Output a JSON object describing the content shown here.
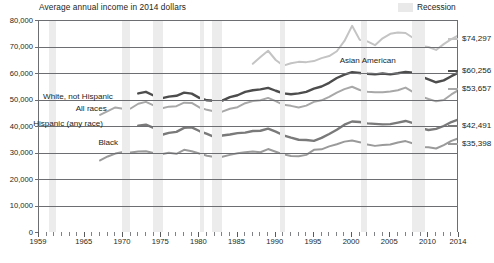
{
  "chart_data": {
    "type": "line",
    "title": "Average annual income in 2014 dollars",
    "xlabel": "",
    "ylabel": "",
    "xlim": [
      1959,
      2014
    ],
    "ylim": [
      0,
      80000
    ],
    "grid": true,
    "legend_position": "top-right",
    "legend_entries": [
      {
        "label": "Recession",
        "color": "#ececec",
        "type": "band"
      }
    ],
    "ytick_labels": [
      "0",
      "10,000",
      "20,000",
      "30,000",
      "40,000",
      "50,000",
      "60,000",
      "70,000",
      "80,000"
    ],
    "ytick_values": [
      0,
      10000,
      20000,
      30000,
      40000,
      50000,
      60000,
      70000,
      80000
    ],
    "xtick_labels": [
      "1959",
      "1965",
      "1970",
      "1975",
      "1980",
      "1985",
      "1990",
      "1995",
      "2000",
      "2005",
      "2010",
      "2014"
    ],
    "xtick_values": [
      1959,
      1965,
      1970,
      1975,
      1980,
      1985,
      1990,
      1995,
      2000,
      2005,
      2010,
      2014
    ],
    "recession_bands": [
      {
        "start": 1960.3,
        "end": 1961.2
      },
      {
        "start": 1969.9,
        "end": 1970.9
      },
      {
        "start": 1973.9,
        "end": 1975.2
      },
      {
        "start": 1980.1,
        "end": 1980.6
      },
      {
        "start": 1981.6,
        "end": 1982.9
      },
      {
        "start": 1990.6,
        "end": 1991.2
      },
      {
        "start": 2001.2,
        "end": 2001.9
      },
      {
        "start": 2007.9,
        "end": 2009.5
      }
    ],
    "series": [
      {
        "name": "Asian American",
        "color": "#c4c4c4",
        "width": 2.0,
        "end_label": "$74,297",
        "end_value": 74297,
        "label_x": 1998.5,
        "label_y": 64400,
        "x": [
          1987,
          1988,
          1989,
          1990,
          1991,
          1992,
          1993,
          1994,
          1995,
          1996,
          1997,
          1998,
          1999,
          2000,
          2001,
          2002,
          2003,
          2004,
          2005,
          2006,
          2007,
          2008,
          2009,
          2010,
          2011,
          2012,
          2013,
          2014
        ],
        "values": [
          63500,
          66000,
          68400,
          64900,
          62800,
          63700,
          64200,
          64100,
          64500,
          65600,
          66400,
          68200,
          72100,
          77800,
          72500,
          71900,
          70500,
          73100,
          74800,
          75300,
          75100,
          73200,
          70200,
          69800,
          68700,
          70900,
          72800,
          74297
        ]
      },
      {
        "name": "White, not Hispanic",
        "color": "#4d4d4d",
        "width": 2.4,
        "end_label": "$60,256",
        "end_value": 60256,
        "label_x": 1968.8,
        "label_y": 50900,
        "x": [
          1972,
          1973,
          1974,
          1975,
          1976,
          1977,
          1978,
          1979,
          1980,
          1981,
          1982,
          1983,
          1984,
          1985,
          1986,
          1987,
          1988,
          1989,
          1990,
          1991,
          1992,
          1993,
          1994,
          1995,
          1996,
          1997,
          1998,
          1999,
          2000,
          2001,
          2002,
          2003,
          2004,
          2005,
          2006,
          2007,
          2008,
          2009,
          2010,
          2011,
          2012,
          2013,
          2014
        ],
        "values": [
          52300,
          52900,
          51500,
          50400,
          51100,
          51400,
          52600,
          52200,
          50600,
          49700,
          49500,
          49600,
          50900,
          51600,
          52900,
          53500,
          53800,
          54400,
          53300,
          52300,
          52000,
          52300,
          52900,
          54100,
          54900,
          56300,
          58100,
          59400,
          60300,
          60000,
          59700,
          59500,
          59800,
          59500,
          59900,
          60400,
          60100,
          58700,
          57600,
          56500,
          57200,
          58800,
          60256
        ]
      },
      {
        "name": "All races",
        "color": "#a8a8a8",
        "width": 2.0,
        "end_label": "$53,657",
        "end_value": 53657,
        "label_x": 1968.0,
        "label_y": 46600,
        "x": [
          1967,
          1968,
          1969,
          1970,
          1971,
          1972,
          1973,
          1974,
          1975,
          1976,
          1977,
          1978,
          1979,
          1980,
          1981,
          1982,
          1983,
          1984,
          1985,
          1986,
          1987,
          1988,
          1989,
          1990,
          1991,
          1992,
          1993,
          1994,
          1995,
          1996,
          1997,
          1998,
          1999,
          2000,
          2001,
          2002,
          2003,
          2004,
          2005,
          2006,
          2007,
          2008,
          2009,
          2010,
          2011,
          2012,
          2013,
          2014
        ],
        "values": [
          44200,
          45600,
          47000,
          46500,
          46600,
          48400,
          49100,
          47800,
          46600,
          47300,
          47500,
          48800,
          48700,
          47000,
          46100,
          45500,
          45400,
          46500,
          47100,
          48600,
          49400,
          49700,
          50600,
          49400,
          48000,
          47600,
          47000,
          47700,
          49100,
          49700,
          51000,
          52600,
          53900,
          54800,
          53600,
          52900,
          52700,
          52700,
          53000,
          53500,
          54500,
          52800,
          51200,
          50200,
          49300,
          49800,
          51900,
          53657
        ]
      },
      {
        "name": "Hispanic (any race)",
        "color": "#7a7a7a",
        "width": 2.4,
        "end_label": "$42,491",
        "end_value": 42491,
        "label_x": 1967.5,
        "label_y": 40600,
        "x": [
          1972,
          1973,
          1974,
          1975,
          1976,
          1977,
          1978,
          1979,
          1980,
          1981,
          1982,
          1983,
          1984,
          1985,
          1986,
          1987,
          1988,
          1989,
          1990,
          1991,
          1992,
          1993,
          1994,
          1995,
          1996,
          1997,
          1998,
          1999,
          2000,
          2001,
          2002,
          2003,
          2004,
          2005,
          2006,
          2007,
          2008,
          2009,
          2010,
          2011,
          2012,
          2013,
          2014
        ],
        "values": [
          40100,
          40500,
          39300,
          36600,
          37400,
          37800,
          39300,
          39500,
          38100,
          37000,
          35800,
          36400,
          36800,
          37300,
          37500,
          38100,
          38200,
          39000,
          37900,
          36500,
          35600,
          34800,
          34700,
          34400,
          35500,
          37000,
          38600,
          40500,
          41700,
          41500,
          41000,
          40800,
          40600,
          40700,
          41300,
          41900,
          41100,
          39200,
          38500,
          38900,
          40000,
          41500,
          42491
        ]
      },
      {
        "name": "Black",
        "color": "#9a9a9a",
        "width": 2.0,
        "end_label": "$35,398",
        "end_value": 35398,
        "label_x": 1969.5,
        "label_y": 33600,
        "x": [
          1967,
          1968,
          1969,
          1970,
          1971,
          1972,
          1973,
          1974,
          1975,
          1976,
          1977,
          1978,
          1979,
          1980,
          1981,
          1982,
          1983,
          1984,
          1985,
          1986,
          1987,
          1988,
          1989,
          1990,
          1991,
          1992,
          1993,
          1994,
          1995,
          1996,
          1997,
          1998,
          1999,
          2000,
          2001,
          2002,
          2003,
          2004,
          2005,
          2006,
          2007,
          2008,
          2009,
          2010,
          2011,
          2012,
          2013,
          2014
        ],
        "values": [
          27000,
          28500,
          29600,
          30200,
          30000,
          30400,
          30500,
          29800,
          29300,
          29900,
          29500,
          31000,
          30500,
          29600,
          28800,
          28300,
          28400,
          29100,
          29700,
          30100,
          30400,
          30100,
          31300,
          30300,
          29300,
          28700,
          28600,
          29100,
          31000,
          31200,
          32300,
          33100,
          34100,
          34500,
          33900,
          33000,
          32500,
          32800,
          33000,
          33800,
          34300,
          33400,
          32100,
          32000,
          31500,
          32800,
          34400,
          35398
        ]
      }
    ]
  }
}
